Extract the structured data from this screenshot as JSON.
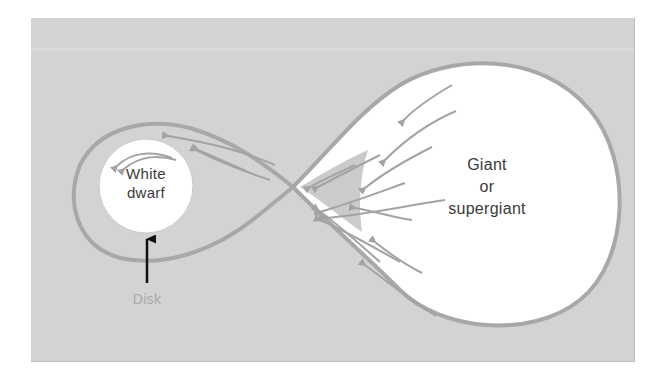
{
  "diagram": {
    "type": "roche-lobe-mass-transfer",
    "labels": {
      "white_dwarf_line1": "White",
      "white_dwarf_line2": "dwarf",
      "giant_line1": "Giant",
      "giant_line2": "or",
      "giant_line3": "supergiant",
      "disk": "Disk"
    },
    "nodes": [
      {
        "id": "white-dwarf",
        "label": "White dwarf",
        "shape": "circle"
      },
      {
        "id": "giant",
        "label": "Giant or supergiant",
        "shape": "lobe-filling"
      },
      {
        "id": "disk",
        "label": "Disk",
        "shape": "accretion-ring"
      }
    ],
    "edges": [
      {
        "from": "giant",
        "to": "white-dwarf",
        "label": "mass transfer flow arrows"
      },
      {
        "from": "disk",
        "to": "white-dwarf",
        "label": "pointer arrow"
      }
    ],
    "colors": {
      "background": "#d3d3d3",
      "lobe_stroke": "#a8a8a8",
      "flow_arrows": "#a3a3a3",
      "star_fill": "#ffffff",
      "pointer_arrow": "#111111",
      "disk_label": "#a9a9a9"
    }
  }
}
